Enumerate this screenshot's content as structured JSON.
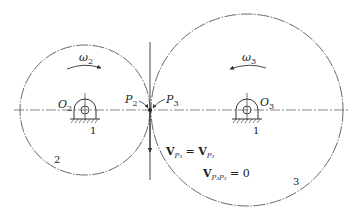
{
  "diagram": {
    "colors": {
      "line": "#333333",
      "background": "#ffffff"
    },
    "gear2": {
      "center": [
        85,
        110
      ],
      "radius": 65,
      "center_label": "O",
      "center_sub": "2",
      "omega_label": "ω",
      "omega_sub": "2",
      "body_number": "2",
      "ground_number": "1"
    },
    "gear3": {
      "center": [
        247,
        110
      ],
      "radius": 96,
      "center_label": "O",
      "center_sub": "3",
      "omega_label": "ω",
      "omega_sub": "3",
      "body_number": "3",
      "ground_number": "1"
    },
    "contact": {
      "point": [
        150,
        110
      ],
      "p2_label": "P",
      "p2_sub": "2",
      "p3_label": "P",
      "p3_sub": "3"
    },
    "equations": {
      "eq1_lhs": "V",
      "eq1_lhs_sub": "P₃",
      "eq1_mid": " = ",
      "eq1_rhs": "V",
      "eq1_rhs_sub": "P₂",
      "eq2_lhs": "V",
      "eq2_lhs_sub": "P₃P₂",
      "eq2_rhs": " = 0"
    }
  }
}
